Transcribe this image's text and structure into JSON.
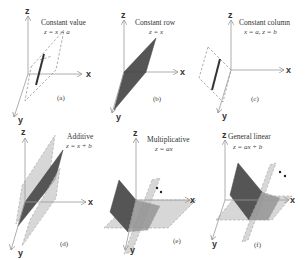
{
  "figure": {
    "panels": [
      {
        "id": "a",
        "title": "Constant value",
        "equation": "z = x = a",
        "caption": "(a)",
        "axes": {
          "z": "z",
          "x": "x",
          "y": "y"
        }
      },
      {
        "id": "b",
        "title": "Constant row",
        "equation": "z = x",
        "caption": "(b)",
        "axes": {
          "z": "z",
          "x": "x",
          "y": "y"
        }
      },
      {
        "id": "c",
        "title": "Constant column",
        "equation": "x = a, z = b",
        "caption": "(c)",
        "axes": {
          "z": "z",
          "x": "x",
          "y": "y"
        }
      },
      {
        "id": "d",
        "title": "Additive",
        "equation": "z = x + b",
        "caption": "(d)",
        "axes": {
          "z": "z",
          "x": "x",
          "y": "y"
        }
      },
      {
        "id": "e",
        "title": "Multiplicative",
        "equation": "z = ax",
        "caption": "(e)",
        "axes": {
          "z": "z",
          "x": "x",
          "y": "y"
        }
      },
      {
        "id": "f",
        "title": "General linear",
        "equation": "z = ax + b",
        "caption": "(f)",
        "axes": {
          "z": "z",
          "x": "x",
          "y": "y"
        }
      }
    ],
    "colors": {
      "dark_plane": "#555555",
      "light_plane": "#c9c9c9",
      "axis": "#999999",
      "text": "#333333"
    }
  }
}
